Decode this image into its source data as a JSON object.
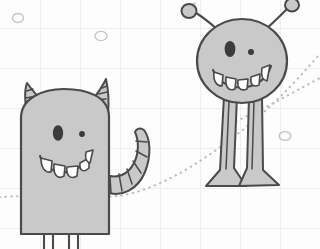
{
  "canvas": {
    "width": 320,
    "height": 249,
    "background_color": "#fdfdfd",
    "title": "Two hand-drawn cartoon monsters on graph paper",
    "medium": "pencil doodle sketch"
  },
  "palette": {
    "paper": "#fdfdfd",
    "grid_line": "#eceef0",
    "ink": "#4a4a4a",
    "body_fill": "#c9c9c9",
    "tooth_fill": "#ffffff",
    "eye": "#3b3b3b",
    "trail": "#bdbfc2",
    "bubble_outline": "#c3c6c9"
  },
  "background": {
    "name": "graph-paper-grid",
    "cell_size_px": 40,
    "vertical_lines_x": [
      40,
      80,
      120,
      160,
      200,
      240,
      280
    ],
    "horizontal_lines_y": [
      28,
      68,
      108,
      148,
      188,
      228
    ]
  },
  "bubbles": [
    {
      "label": "bubble-top-left",
      "cx": 18,
      "cy": 18,
      "rx": 5.5,
      "ry": 4.5
    },
    {
      "label": "bubble-top-mid",
      "cx": 101,
      "cy": 36,
      "rx": 6.0,
      "ry": 4.6
    },
    {
      "label": "bubble-right",
      "cx": 285,
      "cy": 136,
      "rx": 5.8,
      "ry": 4.4
    }
  ],
  "trails": [
    {
      "label": "trail-lower-sweep",
      "description": "dotted path entering at left edge, passing behind the horned monster, rising to the right past the antenna monster",
      "path": "M -6 198 C 30 193, 78 200, 118 196 C 160 190, 205 160, 245 128 C 268 110, 292 86, 318 56"
    },
    {
      "label": "trail-upper-sweep",
      "description": "dotted path arcing from behind the round monster up toward the right edge",
      "path": "M 236 121 C 262 110, 288 95, 320 78"
    },
    {
      "label": "trail-antenna-spark",
      "description": "short dotted flick above the left antenna",
      "path": "M 186 10 C 190 6, 194 3, 198 0"
    }
  ],
  "monsters": [
    {
      "id": "monster-left",
      "name": "horned-box-monster",
      "description": "tall rounded-rectangle body with two striped horns, a curled striped tail, two stick legs cropped by the frame",
      "features": {
        "body_shape": "rounded rectangle",
        "horns": 2,
        "horn_style": "striped cone",
        "tail": "curled striped tail on the right",
        "legs": 2,
        "eyes": [
          {
            "label": "large-oval-eye",
            "cx": 58,
            "cy": 133,
            "rx": 5.2,
            "ry": 7.6
          },
          {
            "label": "small-dot-eye",
            "cx": 81,
            "cy": 134,
            "r": 2.9
          }
        ],
        "teeth_count": 5,
        "expression": "wide grin"
      },
      "geometry": {
        "body_path": "M 22 117 C 22 97, 44 88, 62 88 C 82 88, 108 95, 108 116 L 108 236 L 22 236 Z",
        "horn_left": "M 25 110 C 23 100, 25 88, 27 84 C 31 90, 40 99, 46 104",
        "horn_right": "M 91 103 C 96 96, 103 86, 106 80 C 107 89, 108 104, 107 113",
        "horn_left_stripes": [
          "M 25 104 L 33 101",
          "M 25 98 L 36 95",
          "M 26 92 L 33 89"
        ],
        "horn_right_stripes": [
          "M 95 99 L 104 97",
          "M 99 93 L 106 91",
          "M 102 87 L 106 86"
        ],
        "mouth_path": "M 41 155 C 48 175, 82 180, 91 152",
        "tail_outer": "M 108 190 C 120 195, 135 188, 142 172 C 149 156, 148 140, 143 131",
        "tail_inner": "M 108 173 C 117 177, 127 172, 132 161 C 137 150, 137 139, 134 132",
        "tail_tip": "M 143 131 C 139 128, 135 130, 134 132",
        "tail_stripes": [
          "M 110 177 L 110 192",
          "M 118 175 L 120 190",
          "M 126 169 L 131 183",
          "M 132 161 L 139 172",
          "M 135 150 L 145 156",
          "M 135 140 L 145 142"
        ],
        "leg_left": "M 44 236 L 44 249",
        "leg_left_b": "M 52 236 L 52 249",
        "leg_right": "M 68 236 L 68 249",
        "leg_right_b": "M 76 236 L 76 249"
      },
      "teeth": [
        {
          "x": 43,
          "y": 164,
          "w": 9,
          "h": 10,
          "type": "rounded"
        },
        {
          "x": 55,
          "y": 169,
          "w": 10,
          "h": 11,
          "type": "rounded"
        },
        {
          "x": 67,
          "y": 170,
          "w": 10,
          "h": 11,
          "type": "rounded"
        },
        {
          "x": 79,
          "y": 165,
          "w": 9,
          "h": 10,
          "type": "rounded"
        },
        {
          "x": 87,
          "y": 155,
          "w": 7,
          "h": 10,
          "type": "fang"
        }
      ]
    },
    {
      "id": "monster-right",
      "name": "antenna-ball-monster",
      "description": "round head on two long thin legs with flared feet, two antennae ending in small balls",
      "features": {
        "body_shape": "circle head",
        "antennae": 2,
        "antenna_tip": "ball",
        "legs": 2,
        "feet": "flared triangular feet",
        "eyes": [
          {
            "label": "large-oval-eye",
            "cx": 230,
            "cy": 49,
            "rx": 5.4,
            "ry": 8.0
          },
          {
            "label": "small-dot-eye",
            "cx": 251,
            "cy": 52,
            "r": 3.0
          }
        ],
        "teeth_count": 5,
        "expression": "wide grin"
      },
      "geometry": {
        "head": {
          "cx": 242,
          "cy": 61,
          "rx": 45,
          "ry": 42
        },
        "antenna_left": "M 216 27 C 209 21, 202 16, 194 13",
        "antenna_left_ball": {
          "cx": 189,
          "cy": 11,
          "rx": 7.5,
          "ry": 7.0
        },
        "antenna_right": "M 268 28 C 275 22, 282 15, 288 9",
        "antenna_right_ball": {
          "cx": 292,
          "cy": 5,
          "rx": 7.0,
          "ry": 6.5
        },
        "mouth_path": "M 214 70 C 222 92, 262 94, 270 67",
        "leg_left_outer": "M 226 101 L 221 170 L 208 185 L 245 185 L 236 168 L 238 101",
        "leg_left_inner": "M 229 103 L 226 168",
        "leg_right_outer": "M 250 101 L 248 168 L 240 185 L 277 184 L 263 170 L 262 100",
        "leg_right_inner": "M 254 103 L 252 168",
        "foot_left": "M 208 185 L 221 170 L 236 168 L 245 185 Z",
        "foot_right": "M 240 185 L 248 168 L 263 170 L 277 184 Z"
      },
      "teeth": [
        {
          "x": 216,
          "y": 74,
          "w": 8,
          "h": 11,
          "type": "fang"
        },
        {
          "x": 226,
          "y": 79,
          "w": 10,
          "h": 11,
          "type": "rounded"
        },
        {
          "x": 238,
          "y": 81,
          "w": 10,
          "h": 11,
          "type": "rounded"
        },
        {
          "x": 250,
          "y": 79,
          "w": 10,
          "h": 11,
          "type": "rounded"
        },
        {
          "x": 261,
          "y": 71,
          "w": 8,
          "h": 12,
          "type": "fang"
        }
      ]
    }
  ],
  "watermark": {
    "text": "",
    "visible": false
  }
}
